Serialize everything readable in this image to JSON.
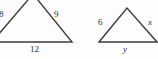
{
  "figure": {
    "stroke_color": "#3a3a3a",
    "background_color": "#fdfdfd",
    "triangles": [
      {
        "name": "left-triangle",
        "points": "-8,42 33,-6 72,42",
        "labels": {
          "left_side": "8",
          "right_side": "9",
          "base": "12"
        }
      },
      {
        "name": "right-triangle",
        "points": "99,42 127,8 157,42",
        "labels": {
          "left_side": "6",
          "right_side": "x",
          "base": "y"
        }
      }
    ]
  }
}
